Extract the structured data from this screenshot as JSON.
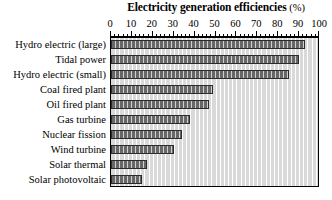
{
  "chart_data": {
    "type": "bar",
    "orientation": "horizontal",
    "title": "Electricity generation efficiencies (%)",
    "title_main": "Electricity generation efficiencies",
    "title_unit": "(%)",
    "xlabel": "",
    "ylabel": "",
    "xlim": [
      0,
      100
    ],
    "grid": true,
    "grid_axis": "x",
    "legend": "none",
    "major_tick_step": 10,
    "minor_tick_step": 2,
    "x_tick_labels": [
      "0",
      "10",
      "20",
      "30",
      "40",
      "50",
      "60",
      "70",
      "80",
      "90",
      "100"
    ],
    "x_tick_values": [
      0,
      10,
      20,
      30,
      40,
      50,
      60,
      70,
      80,
      90,
      100
    ],
    "categories": [
      "Hydro electric (large)",
      "Tidal power",
      "Hydro electric (small)",
      "Coal fired plant",
      "Oil fired plant",
      "Gas turbine",
      "Nuclear fission",
      "Wind turbine",
      "Solar thermal",
      "Solar photovoltaic"
    ],
    "values": [
      93,
      90,
      85,
      49,
      47,
      38,
      34,
      30,
      17,
      15
    ],
    "bar_color": "#676767",
    "bar_pattern": "vertical-hatch",
    "plot_background": "#d9d9d9",
    "gridline_color": "#ffffff",
    "axis_color": "#000000"
  }
}
